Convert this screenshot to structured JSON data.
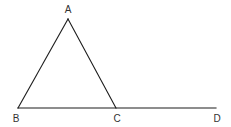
{
  "figure": {
    "type": "geometry-diagram",
    "background_color": "#ffffff",
    "line_color": "#1c1c1c",
    "label_color": "#333333",
    "canvas": {
      "width": 231,
      "height": 127
    },
    "points": {
      "A": {
        "label": "A",
        "x": 68,
        "y": 19,
        "label_x": 68,
        "label_y": 13
      },
      "B": {
        "label": "B",
        "x": 18,
        "y": 108,
        "label_x": 16,
        "label_y": 122
      },
      "C": {
        "label": "C",
        "x": 116,
        "y": 108,
        "label_x": 117,
        "label_y": 122
      },
      "D": {
        "label": "D",
        "x": 216,
        "y": 108,
        "label_x": 217,
        "label_y": 122
      }
    },
    "segments": [
      {
        "name": "segment-AB",
        "from": "A",
        "to": "B"
      },
      {
        "name": "segment-AC",
        "from": "A",
        "to": "C"
      },
      {
        "name": "segment-BD",
        "from": "B",
        "to": "D"
      }
    ]
  }
}
